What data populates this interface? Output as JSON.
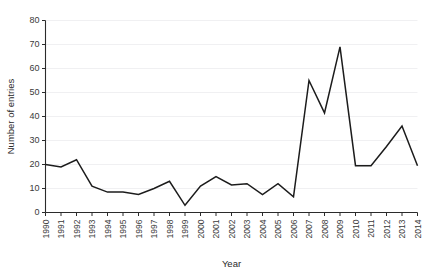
{
  "chart_data": {
    "type": "line",
    "title": "",
    "xlabel": "Year",
    "ylabel": "Number of entries",
    "categories": [
      "1990",
      "1991",
      "1992",
      "1993",
      "1994",
      "1995",
      "1996",
      "1997",
      "1998",
      "1999",
      "2000",
      "2001",
      "2002",
      "2003",
      "2004",
      "2005",
      "2006",
      "2007",
      "2008",
      "2009",
      "2010",
      "2011",
      "2012",
      "2013",
      "2014"
    ],
    "values": [
      20,
      19,
      22,
      11,
      8.5,
      8.5,
      7.5,
      10,
      13,
      3,
      11,
      15,
      11.5,
      12,
      7.5,
      12,
      6.5,
      55,
      41.5,
      69,
      19.5,
      19.5,
      27.5,
      36,
      19.5
    ],
    "series": [
      {
        "name": "Number of entries",
        "values": [
          20,
          19,
          22,
          11,
          8.5,
          8.5,
          7.5,
          10,
          13,
          3,
          11,
          15,
          11.5,
          12,
          7.5,
          12,
          6.5,
          55,
          41.5,
          69,
          19.5,
          19.5,
          27.5,
          36,
          19.5
        ]
      }
    ],
    "ylim": [
      0,
      80
    ],
    "yticks": [
      0,
      10,
      20,
      30,
      40,
      50,
      60,
      70,
      80
    ],
    "ytick_labels": [
      "0",
      "10",
      "20",
      "30",
      "40",
      "50",
      "60",
      "70",
      "80"
    ],
    "xlim": [
      "1990",
      "2014"
    ],
    "grid": "horizontal",
    "legend": "none",
    "line_color": "#1c1c1c",
    "grid_color": "#f0f0f2",
    "axis_color": "#2b2b2b"
  }
}
